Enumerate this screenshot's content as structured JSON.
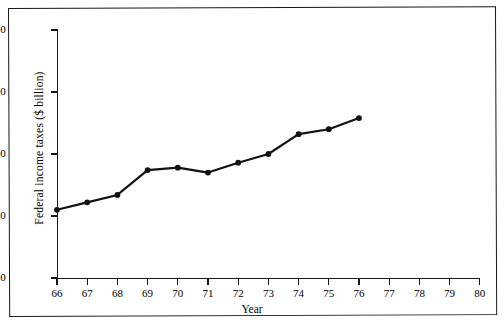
{
  "chart_data": {
    "type": "line",
    "title": "",
    "xlabel": "Year",
    "ylabel": "Federal income taxes ($ billion)",
    "x": [
      66,
      67,
      68,
      69,
      70,
      71,
      72,
      73,
      74,
      75,
      76
    ],
    "values": [
      55,
      61,
      67,
      87,
      89,
      85,
      93,
      100,
      116,
      120,
      129
    ],
    "series": [
      {
        "name": "Federal income taxes",
        "values": [
          55,
          61,
          67,
          87,
          89,
          85,
          93,
          100,
          116,
          120,
          129
        ]
      }
    ],
    "xlim": [
      66,
      80
    ],
    "ylim": [
      0,
      200
    ],
    "xticks": [
      66,
      67,
      68,
      69,
      70,
      71,
      72,
      73,
      74,
      75,
      76,
      77,
      78,
      79,
      80
    ],
    "xtick_labels": [
      "66",
      "67",
      "68",
      "69",
      "70",
      "71",
      "72",
      "73",
      "74",
      "75",
      "76",
      "77",
      "78",
      "79",
      "80"
    ],
    "yticks": [
      0,
      50,
      100,
      150,
      200
    ],
    "ytick_labels": [
      "0",
      "50",
      "100",
      "150",
      "200"
    ],
    "grid": false,
    "legend": false,
    "marker": "filled-circle",
    "line_color": "#111111",
    "marker_color": "#111111",
    "axis_color": "#15181c"
  },
  "figure": {
    "border_color": "#15181c",
    "background": "#ffffff",
    "caption_fragment": ""
  }
}
